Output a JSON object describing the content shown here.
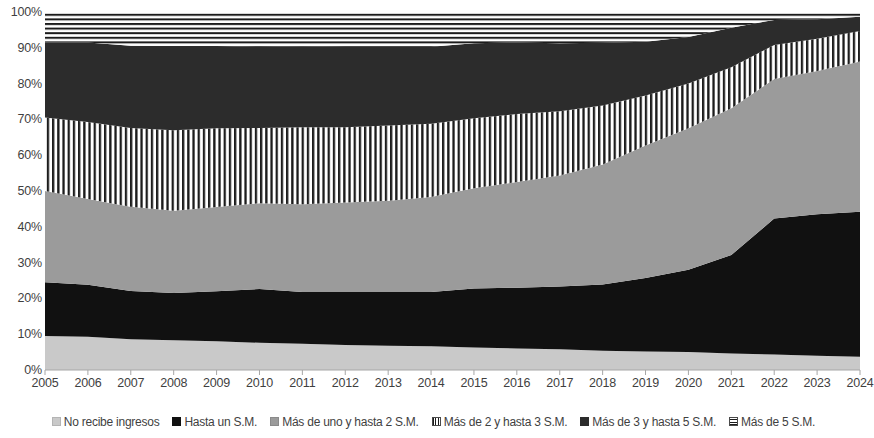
{
  "chart_data": {
    "type": "area",
    "stacked": true,
    "stack_mode": "percent",
    "title": "",
    "subtitle": "",
    "xlabel": "",
    "ylabel": "",
    "grid": false,
    "legend_position": "bottom",
    "ylim": [
      0,
      100
    ],
    "y_ticks": [
      "0%",
      "10%",
      "20%",
      "30%",
      "40%",
      "50%",
      "60%",
      "70%",
      "80%",
      "90%",
      "100%"
    ],
    "y_tick_values": [
      0,
      10,
      20,
      30,
      40,
      50,
      60,
      70,
      80,
      90,
      100
    ],
    "categories": [
      "2005",
      "2006",
      "2007",
      "2008",
      "2009",
      "2010",
      "2011",
      "2012",
      "2013",
      "2014",
      "2015",
      "2016",
      "2017",
      "2018",
      "2019",
      "2020",
      "2021",
      "2022",
      "2023",
      "2024"
    ],
    "x": [
      2005,
      2006,
      2007,
      2008,
      2009,
      2010,
      2011,
      2012,
      2013,
      2014,
      2015,
      2016,
      2017,
      2018,
      2019,
      2020,
      2021,
      2022,
      2023,
      2024
    ],
    "series": [
      {
        "name": "No recibe ingresos",
        "pattern": "solid",
        "color": "#c9c9c9",
        "values": [
          9.5,
          9.3,
          8.6,
          8.3,
          8.0,
          7.6,
          7.3,
          7.0,
          6.8,
          6.6,
          6.3,
          6.0,
          5.8,
          5.4,
          5.2,
          5.0,
          4.6,
          4.3,
          4.0,
          3.7
        ]
      },
      {
        "name": "Hasta un S.M.",
        "pattern": "solid",
        "color": "#111111",
        "values": [
          15.0,
          14.5,
          13.5,
          13.2,
          14.0,
          15.0,
          14.5,
          14.8,
          15.0,
          15.2,
          16.5,
          17.0,
          17.5,
          18.5,
          20.5,
          23.0,
          27.5,
          38.0,
          39.5,
          40.5
        ]
      },
      {
        "name": "Más de uno y hasta 2 S.M.",
        "pattern": "solid",
        "color": "#9b9b9b",
        "values": [
          25.5,
          24.0,
          23.5,
          23.0,
          23.5,
          24.0,
          24.5,
          25.0,
          25.5,
          26.5,
          28.0,
          29.5,
          31.0,
          33.5,
          37.0,
          39.5,
          41.0,
          39.0,
          40.0,
          42.0
        ]
      },
      {
        "name": "Más de 2 y hasta 3 S.M.",
        "pattern": "vertical-stripes",
        "color": "#1c1c1c",
        "values": [
          20.5,
          21.5,
          22.0,
          22.5,
          22.0,
          21.0,
          21.5,
          21.0,
          21.0,
          20.5,
          19.5,
          19.0,
          18.0,
          16.5,
          14.0,
          12.5,
          11.5,
          9.5,
          9.0,
          8.5
        ]
      },
      {
        "name": "Más de 3 y hasta 5 S.M.",
        "pattern": "solid",
        "color": "#2c2c2c",
        "values": [
          21.0,
          22.2,
          23.0,
          23.5,
          23.0,
          22.7,
          22.6,
          22.5,
          22.0,
          21.5,
          21.0,
          20.0,
          19.0,
          17.5,
          15.0,
          13.0,
          11.0,
          7.0,
          5.5,
          4.0
        ]
      },
      {
        "name": "Más de 5 S.M.",
        "pattern": "horizontal-stripes",
        "color": "#1c1c1c",
        "values": [
          8.5,
          8.5,
          9.4,
          9.5,
          9.5,
          9.7,
          9.6,
          9.7,
          9.7,
          9.7,
          8.7,
          8.5,
          8.7,
          8.6,
          8.3,
          7.0,
          4.4,
          2.2,
          2.0,
          1.3
        ]
      }
    ]
  },
  "legend": {
    "items": [
      {
        "label": "No recibe ingresos",
        "swatch": "solid-light-gray-swatch"
      },
      {
        "label": "Hasta un S.M.",
        "swatch": "solid-black-swatch"
      },
      {
        "label": "Más de uno y hasta 2 S.M.",
        "swatch": "solid-mid-gray-swatch"
      },
      {
        "label": "Más de 2 y hasta 3 S.M.",
        "swatch": "vertical-stripe-swatch"
      },
      {
        "label": "Más de 3 y hasta 5 S.M.",
        "swatch": "solid-dark-gray-swatch"
      },
      {
        "label": "Más de 5 S.M.",
        "swatch": "horizontal-stripe-swatch"
      }
    ]
  }
}
